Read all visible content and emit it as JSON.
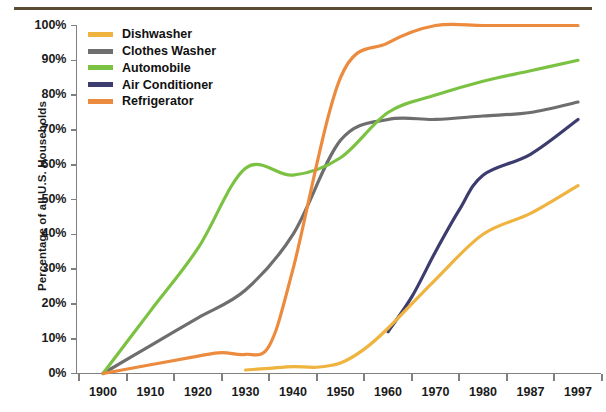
{
  "chart_data": {
    "type": "line",
    "title": "",
    "subtitle": "",
    "xlabel": "",
    "ylabel": "Percentage of all U.S. Households",
    "x_tick_labels": [
      "1900",
      "1910",
      "1920",
      "1930",
      "1940",
      "1950",
      "1960",
      "1970",
      "1980",
      "1987",
      "1997"
    ],
    "y_tick_labels": [
      "0%",
      "10%",
      "20%",
      "30%",
      "40%",
      "50%",
      "60%",
      "70%",
      "80%",
      "90%",
      "100%"
    ],
    "ylim": [
      0,
      100
    ],
    "x_axis_type": "categorical-evenly-spaced",
    "grid": false,
    "legend_position": "top-left-inside",
    "series": [
      {
        "name": "Dishwasher",
        "color": "#EFB33F",
        "x": [
          "1930",
          "1935",
          "1940",
          "1945",
          "1950",
          "1955",
          "1960",
          "1970",
          "1980",
          "1987",
          "1997"
        ],
        "values": [
          1,
          1.5,
          2,
          1.8,
          3,
          7,
          13,
          27,
          40,
          46,
          54
        ]
      },
      {
        "name": "Clothes Washer",
        "color": "#6E6E6E",
        "x": [
          "1900",
          "1910",
          "1920",
          "1930",
          "1940",
          "1950",
          "1960",
          "1970",
          "1980",
          "1987",
          "1997"
        ],
        "values": [
          0,
          8,
          16,
          24,
          40,
          67,
          73,
          73,
          74,
          75,
          78
        ]
      },
      {
        "name": "Automobile",
        "color": "#7CC242",
        "x": [
          "1900",
          "1910",
          "1920",
          "1930",
          "1940",
          "1950",
          "1960",
          "1970",
          "1980",
          "1987",
          "1997"
        ],
        "values": [
          0,
          18,
          36,
          59,
          57,
          62,
          75,
          80,
          84,
          87,
          90
        ]
      },
      {
        "name": "Air Conditioner",
        "color": "#3C3C6E",
        "x": [
          "1960",
          "1965",
          "1970",
          "1975",
          "1980",
          "1987",
          "1997"
        ],
        "values": [
          12,
          22,
          35,
          47,
          57,
          63,
          73
        ]
      },
      {
        "name": "Refrigerator",
        "color": "#EC8A3D",
        "x": [
          "1900",
          "1910",
          "1920",
          "1925",
          "1930",
          "1935",
          "1940",
          "1950",
          "1960",
          "1970",
          "1980",
          "1987",
          "1997"
        ],
        "values": [
          0,
          2.5,
          5,
          6,
          5.5,
          8,
          30,
          85,
          95,
          100,
          100,
          100,
          100
        ]
      }
    ]
  },
  "legend": {
    "items": [
      {
        "label": "Dishwasher",
        "color": "#EFB33F"
      },
      {
        "label": "Clothes Washer",
        "color": "#6E6E6E"
      },
      {
        "label": "Automobile",
        "color": "#7CC242"
      },
      {
        "label": "Air Conditioner",
        "color": "#3C3C6E"
      },
      {
        "label": "Refrigerator",
        "color": "#EC8A3D"
      }
    ]
  },
  "axes": {
    "y_title": "Percentage of all U.S. Households",
    "axis_color": "#808080",
    "top_rule_color": "#5a4d34"
  }
}
